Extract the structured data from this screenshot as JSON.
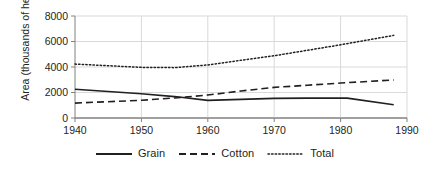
{
  "chart_data": {
    "type": "line",
    "title": "",
    "xlabel": "",
    "ylabel": "Area",
    "ylabel_unit": "(thousands of hectares)",
    "xlim": [
      1940,
      1990
    ],
    "ylim": [
      0,
      8000
    ],
    "xticks": [
      1940,
      1950,
      1960,
      1970,
      1980,
      1990
    ],
    "yticks": [
      0,
      2000,
      4000,
      6000,
      8000
    ],
    "xtick_labels": [
      "1940",
      "1950",
      "1960",
      "1970",
      "1980",
      "1990"
    ],
    "ytick_labels": [
      "0",
      "2000",
      "4000",
      "6000",
      "8000"
    ],
    "grid": true,
    "grid_axis": "y",
    "legend_position": "bottom",
    "line_color": "#231f20",
    "grid_color": "#d9d9d9",
    "axis_color": "#808080",
    "series": [
      {
        "name": "Grain",
        "style": "solid",
        "x": [
          1940,
          1950,
          1955,
          1960,
          1965,
          1970,
          1975,
          1980,
          1981,
          1988
        ],
        "values": [
          2260,
          1900,
          1680,
          1380,
          1460,
          1540,
          1560,
          1570,
          1560,
          1040
        ]
      },
      {
        "name": "Cotton",
        "style": "dashed",
        "x": [
          1940,
          1950,
          1955,
          1960,
          1965,
          1970,
          1975,
          1980,
          1988
        ],
        "values": [
          1170,
          1390,
          1570,
          1800,
          2120,
          2400,
          2570,
          2740,
          2980
        ]
      },
      {
        "name": "Total",
        "style": "dotted",
        "x": [
          1940,
          1950,
          1955,
          1960,
          1965,
          1970,
          1975,
          1980,
          1988
        ],
        "values": [
          4230,
          3970,
          3950,
          4160,
          4530,
          4880,
          5310,
          5740,
          6480
        ]
      }
    ]
  },
  "legend": {
    "items": [
      {
        "label": "Grain",
        "style": "solid"
      },
      {
        "label": "Cotton",
        "style": "dashed"
      },
      {
        "label": "Total",
        "style": "dotted"
      }
    ]
  }
}
